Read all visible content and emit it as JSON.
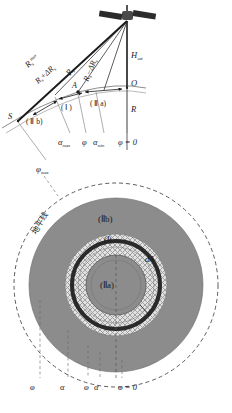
{
  "figure": {
    "title_top_panel": "satellite-viewing-geometry-side-view",
    "title_bottom_panel": "concentric-zone-map-nadir-view"
  },
  "top_panel": {
    "satellite": "satellite-icon",
    "labels": {
      "R_s_max": "R",
      "R_s_max_sub": "s",
      "R_s_max_sup": "max",
      "R_plus_dR": "R",
      "R_plus_dR_sub": "s",
      "R_plus_dR_rest": "+ΔR",
      "R_plus_dR_rest_sub": "s",
      "R_s": "R",
      "R_s_sub": "s",
      "R_minus_dR": "R",
      "R_minus_dR_sub": "s",
      "R_minus_dR_rest": "−ΔR",
      "R_minus_dR_rest_sub": "s",
      "H_sat": "H",
      "H_sat_sub": "sat",
      "point_O": "O",
      "point_S": "S",
      "point_A": "A",
      "earth_radius": "R",
      "zone_I": "( Ⅰ )",
      "zone_IIa": "( Ⅱ a)",
      "zone_IIb": "( Ⅱ b)"
    },
    "angle_ticks": [
      {
        "name": "alpha-max",
        "base": "α",
        "sub": "max"
      },
      {
        "name": "phi",
        "base": "φ",
        "sub": ""
      },
      {
        "name": "alpha-min",
        "base": "α",
        "sub": "min"
      },
      {
        "name": "phi-zero",
        "base": "φ = 0",
        "sub": ""
      }
    ]
  },
  "bottom_panel": {
    "labels": {
      "phi_max": "φ",
      "phi_max_sub": "max",
      "horizon_cn": "地平线",
      "zone_IIb": "(Ⅱb)",
      "zone_I": "(Ⅰ)",
      "zone_IIa": "(Ⅱa)",
      "dA": "dA"
    },
    "angle_ticks": [
      {
        "name": "phi-max",
        "base": "φ",
        "sub": "max"
      },
      {
        "name": "alpha-max",
        "base": "α",
        "sub": "max"
      },
      {
        "name": "phi",
        "base": "φ",
        "sub": ""
      },
      {
        "name": "alpha-min",
        "base": "α",
        "sub": "min"
      },
      {
        "name": "phi-zero",
        "base": "φ = 0",
        "sub": ""
      }
    ]
  },
  "colors": {
    "ink": "#1a1a1a",
    "gray_fill": "#8c8c8c",
    "light_gray": "#d9d9d9",
    "hatch": "#b5b5b5",
    "white": "#ffffff",
    "dashed": "#555555"
  }
}
